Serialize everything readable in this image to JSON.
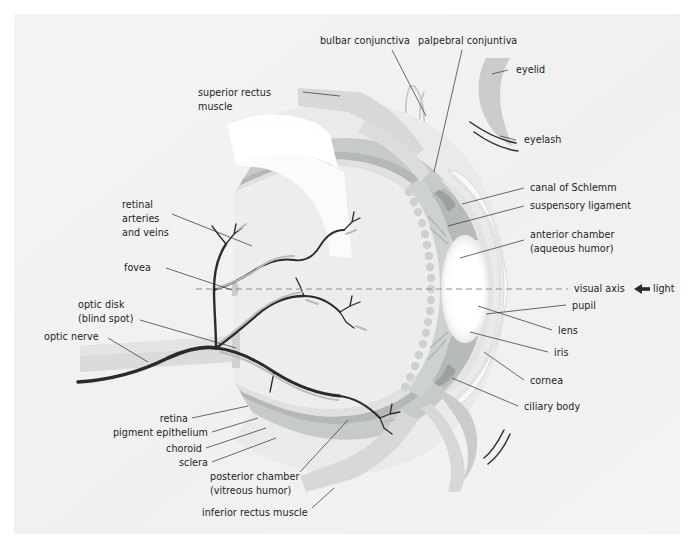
{
  "figure": {
    "background_color": "#ffffff",
    "page_color": "#f1f2f1",
    "text_color": "#1d1d1d",
    "leader_color": "#3a3a3a"
  },
  "palette": {
    "sclera": "#e6e8e7",
    "choroid": "#c6cac9",
    "retina": "#dcdedd",
    "vitreous": "#eceeed",
    "ciliary_body": "#cdd1d0",
    "iris": "#b8bcbb",
    "lens": "#ffffff",
    "cornea": "#f7f8f8",
    "eyelid": "#c9cccb",
    "muscle": "#d6d9d8",
    "optic_nerve": "#d9dcdb",
    "vessel_dark": "#2b2b2b",
    "vessel_light": "#b9bcbd",
    "axis_line": "#8e8e8e"
  },
  "labels": {
    "bulbar_conjunctiva": "bulbar conjunctiva",
    "palpebral_conjunctiva": "palpebral conjuntiva",
    "eyelid": "eyelid",
    "eyelash": "eyelash",
    "superior_rectus_line1": "superior rectus",
    "superior_rectus_line2": "muscle",
    "canal_of_schlemm": "canal of Schlemm",
    "suspensory_ligament": "suspensory ligament",
    "anterior_chamber_line1": "anterior chamber",
    "anterior_chamber_line2": "(aqueous humor)",
    "retinal_vessels_line1": "retinal",
    "retinal_vessels_line2": "arteries",
    "retinal_vessels_line3": "and veins",
    "fovea": "fovea",
    "optic_disk_line1": "optic disk",
    "optic_disk_line2": "(blind spot)",
    "optic_nerve": "optic nerve",
    "visual_axis": "visual axis",
    "light": "light",
    "pupil": "pupil",
    "lens": "lens",
    "iris": "iris",
    "cornea": "cornea",
    "ciliary_body": "ciliary body",
    "retina": "retina",
    "pigment_epithelium": "pigment epithelium",
    "choroid": "choroid",
    "sclera": "sclera",
    "posterior_chamber_line1": "posterior chamber",
    "posterior_chamber_line2": "(vitreous humor)",
    "inferior_rectus": "inferior rectus muscle"
  },
  "icons": {
    "light_arrow": "left-arrow-icon"
  }
}
